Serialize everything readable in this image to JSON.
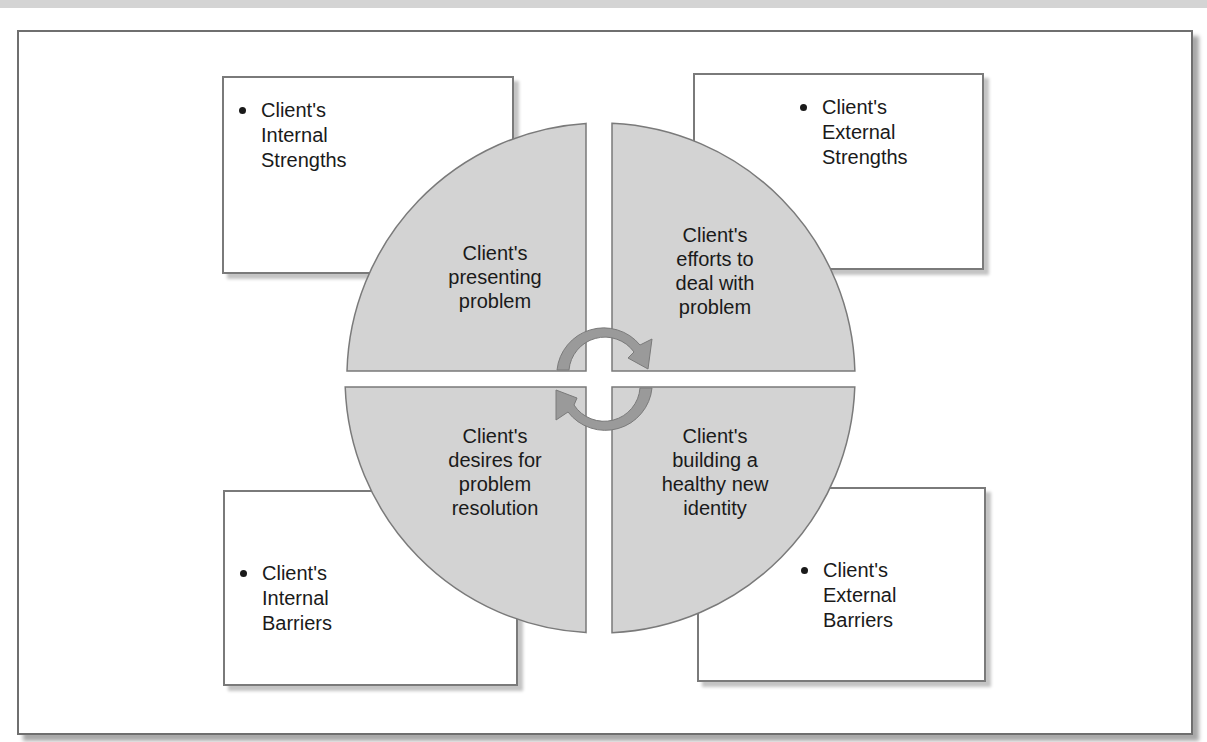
{
  "diagram": {
    "type": "quadrant-circle-with-surrounding-boxes",
    "center_icon": "cycle-arrows-icon",
    "colors": {
      "quadrant_fill": "#d3d3d3",
      "quadrant_stroke": "#7a7a7a",
      "arrow_fill": "#9a9a9a",
      "box_border": "#7a7a7a",
      "frame_border": "#6f6f6f",
      "text": "#1a1a1a"
    },
    "quadrants": {
      "top_left": {
        "lines": [
          "Client's",
          "presenting",
          "problem"
        ]
      },
      "top_right": {
        "lines": [
          "Client's",
          "efforts to",
          "deal with",
          "problem"
        ]
      },
      "bottom_left": {
        "lines": [
          "Client's",
          "desires for",
          "problem",
          "resolution"
        ]
      },
      "bottom_right": {
        "lines": [
          "Client's",
          "building a",
          "healthy new",
          "identity"
        ]
      }
    },
    "boxes": {
      "top_left": {
        "lines": [
          "Client's",
          "Internal",
          "Strengths"
        ]
      },
      "top_right": {
        "lines": [
          "Client's",
          "External",
          "Strengths"
        ]
      },
      "bottom_left": {
        "lines": [
          "Client's",
          "Internal",
          "Barriers"
        ]
      },
      "bottom_right": {
        "lines": [
          "Client's",
          "External",
          "Barriers"
        ]
      }
    }
  }
}
